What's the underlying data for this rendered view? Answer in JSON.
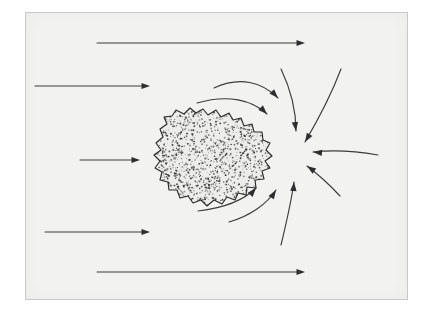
{
  "figure": {
    "domain": "Diagram",
    "background_color": "#f2f2f0",
    "page_color": "#ffffff",
    "ink_color": "#2e2e2e",
    "frame": {
      "x": 25,
      "y": 12,
      "width": 383,
      "height": 288,
      "border_color": "#c9c9c6"
    }
  },
  "object": {
    "name": "irregular-body",
    "label": "",
    "fill_color": "#ededeb",
    "outline_color": "#2b2b2b",
    "texture": "stipple",
    "stipple_count": 1150,
    "center": {
      "x": 212,
      "y": 160
    },
    "bounds": {
      "x": 155,
      "y": 108,
      "width": 118,
      "height": 100
    },
    "outline_points": [
      [
        163,
        137
      ],
      [
        160,
        129
      ],
      [
        167,
        124
      ],
      [
        164,
        117
      ],
      [
        172,
        116
      ],
      [
        176,
        110
      ],
      [
        184,
        114
      ],
      [
        190,
        108
      ],
      [
        196,
        113
      ],
      [
        203,
        109
      ],
      [
        208,
        115
      ],
      [
        216,
        110
      ],
      [
        221,
        117
      ],
      [
        229,
        113
      ],
      [
        233,
        120
      ],
      [
        241,
        118
      ],
      [
        244,
        126
      ],
      [
        252,
        124
      ],
      [
        254,
        132
      ],
      [
        262,
        132
      ],
      [
        263,
        140
      ],
      [
        270,
        143
      ],
      [
        266,
        150
      ],
      [
        272,
        156
      ],
      [
        265,
        161
      ],
      [
        270,
        168
      ],
      [
        262,
        171
      ],
      [
        264,
        179
      ],
      [
        255,
        180
      ],
      [
        256,
        188
      ],
      [
        247,
        187
      ],
      [
        246,
        195
      ],
      [
        238,
        193
      ],
      [
        235,
        200
      ],
      [
        227,
        197
      ],
      [
        222,
        204
      ],
      [
        214,
        200
      ],
      [
        207,
        206
      ],
      [
        201,
        200
      ],
      [
        193,
        203
      ],
      [
        188,
        196
      ],
      [
        180,
        198
      ],
      [
        177,
        190
      ],
      [
        169,
        190
      ],
      [
        168,
        182
      ],
      [
        160,
        180
      ],
      [
        162,
        172
      ],
      [
        155,
        168
      ],
      [
        160,
        161
      ],
      [
        154,
        155
      ],
      [
        161,
        150
      ],
      [
        156,
        143
      ]
    ]
  },
  "flow": {
    "straight_arrows": [
      {
        "name": "inflow-arrow-top",
        "x1": 97,
        "y1": 43,
        "x2": 305,
        "y2": 43
      },
      {
        "name": "inflow-arrow-upper",
        "x1": 35,
        "y1": 86,
        "x2": 150,
        "y2": 86
      },
      {
        "name": "inflow-arrow-middle",
        "x1": 80,
        "y1": 160,
        "x2": 140,
        "y2": 160
      },
      {
        "name": "inflow-arrow-lower",
        "x1": 45,
        "y1": 232,
        "x2": 150,
        "y2": 232
      },
      {
        "name": "inflow-arrow-bottom",
        "x1": 97,
        "y1": 272,
        "x2": 305,
        "y2": 272
      }
    ],
    "curved_arrows": [
      {
        "name": "deflected-arrow-upper-inner",
        "path": "M 214,88 C 240,76 262,82 278,98",
        "tip": [
          278,
          98
        ],
        "angle": 47
      },
      {
        "name": "deflected-arrow-upper-outer",
        "path": "M 197,103 C 228,94 252,100 267,114",
        "tip": [
          267,
          114
        ],
        "angle": 45
      },
      {
        "name": "converging-arrow-top-left",
        "path": "M 281,69 C 292,92 296,112 296,131",
        "tip": [
          296,
          131
        ],
        "angle": 83
      },
      {
        "name": "converging-arrow-top-right",
        "path": "M 341,69 C 330,98 315,125 305,142",
        "tip": [
          305,
          142
        ],
        "angle": 121
      },
      {
        "name": "converging-arrow-right",
        "path": "M 378,155 C 350,150 330,150 313,152",
        "tip": [
          313,
          152
        ],
        "angle": 186
      },
      {
        "name": "converging-arrow-bottom-right",
        "path": "M 340,196 C 328,183 315,172 307,166",
        "tip": [
          307,
          166
        ],
        "angle": 215
      },
      {
        "name": "converging-arrow-bottom-mid",
        "path": "M 281,245 C 288,216 292,196 294,182",
        "tip": [
          294,
          182
        ],
        "angle": 274
      },
      {
        "name": "deflected-arrow-lower-outer",
        "path": "M 229,222 C 250,216 267,204 276,190",
        "tip": [
          276,
          190
        ],
        "angle": 302
      },
      {
        "name": "deflected-arrow-lower-inner",
        "path": "M 198,211 C 224,208 244,200 256,188",
        "tip": [
          256,
          188
        ],
        "angle": 310
      }
    ],
    "convergence_point": {
      "x": 303,
      "y": 156
    }
  }
}
